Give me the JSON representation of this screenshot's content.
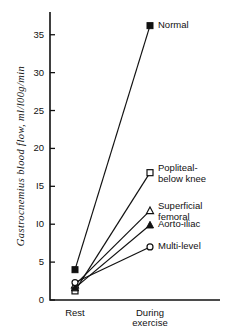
{
  "chart_data": {
    "type": "line",
    "title": "",
    "xlabel": "",
    "ylabel": "Gastrocnemius blood flow, ml/l00g/min",
    "categories": [
      "Rest",
      "During exercise"
    ],
    "category_labels": [
      {
        "line1": "Rest",
        "line2": ""
      },
      {
        "line1": "During",
        "line2": "exercise"
      }
    ],
    "ylim": [
      0,
      38
    ],
    "yticks": [
      0,
      5,
      10,
      15,
      20,
      25,
      30,
      35
    ],
    "ytick_labels": [
      "0",
      "5",
      "I0",
      "I5",
      "20",
      "25",
      "30",
      "35"
    ],
    "grid": false,
    "legend_position": "right-inline-at-endpoints",
    "series": [
      {
        "name": "Normal",
        "marker": "filled-square",
        "values": [
          4.0,
          36.2
        ]
      },
      {
        "name": "Popliteal-below knee",
        "label_line1": "Popliteal-",
        "label_line2": "below knee",
        "marker": "open-square",
        "values": [
          1.2,
          16.8
        ]
      },
      {
        "name": "Superficial femoral",
        "label_line1": "Superficial",
        "label_line2": "femoral",
        "marker": "open-triangle",
        "values": [
          2.0,
          11.8
        ]
      },
      {
        "name": "Aorto-iliac",
        "label_line1": "Aorto-iliac",
        "label_line2": "",
        "marker": "filled-triangle",
        "values": [
          1.6,
          9.9
        ]
      },
      {
        "name": "Multi-level",
        "label_line1": "Multi-level",
        "label_line2": "",
        "marker": "open-circle",
        "values": [
          2.3,
          7.0
        ]
      }
    ]
  },
  "colors": {
    "ink": "#111111",
    "background": "#ffffff"
  }
}
